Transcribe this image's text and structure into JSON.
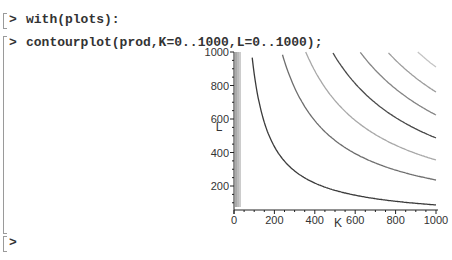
{
  "worksheet": {
    "lines": [
      {
        "prompt": ">",
        "input": "with(plots):"
      },
      {
        "prompt": ">",
        "input": "contourplot(prod,K=0..1000,L=0..1000);"
      },
      {
        "prompt": ">",
        "input": ""
      }
    ]
  },
  "chart_data": {
    "type": "contour",
    "title": "",
    "xlabel": "K",
    "ylabel": "L",
    "xlim": [
      0,
      1000
    ],
    "ylim": [
      0,
      1000
    ],
    "x_ticks": [
      0,
      200,
      400,
      600,
      800,
      1000
    ],
    "y_ticks": [
      200,
      400,
      600,
      800,
      1000
    ],
    "x_tick_labels": [
      "0",
      "200",
      "400",
      "600",
      "800",
      "1000"
    ],
    "y_tick_labels": [
      "200",
      "400",
      "600",
      "800",
      "1000"
    ],
    "grid": false,
    "legend": "none",
    "contours": [
      {
        "level_index": 1,
        "color": "#3a3a3a",
        "L_at_K1000": 87
      },
      {
        "level_index": 2,
        "color": "#6e6e6e",
        "L_at_K1000": 236
      },
      {
        "level_index": 3,
        "color": "#a8a8a8",
        "L_at_K1000": 355
      },
      {
        "level_index": 4,
        "color": "#4a4a4a",
        "L_at_K1000": 487
      },
      {
        "level_index": 5,
        "color": "#858585",
        "L_at_K1000": 624
      },
      {
        "level_index": 6,
        "color": "#9e9e9e",
        "L_at_K1000": 761
      },
      {
        "level_index": 7,
        "color": "#c4c4c4",
        "L_at_K1000": 910
      }
    ]
  }
}
